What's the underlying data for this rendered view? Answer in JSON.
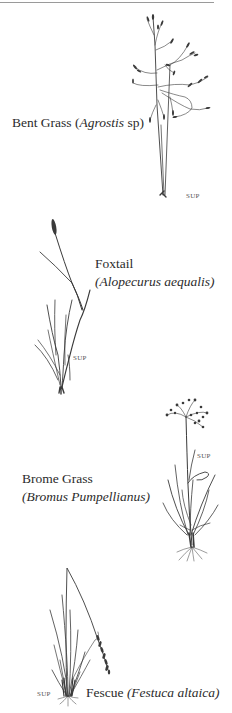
{
  "plants": [
    {
      "common_name": "Bent Grass",
      "scientific_name": "Agrostis",
      "scientific_suffix": " sp)",
      "label_prefix": "(",
      "sup": "SUP"
    },
    {
      "common_name": "Foxtail",
      "scientific_name": "(Alopecurus  aequalis)",
      "sup": "SUP"
    },
    {
      "common_name": "Brome Grass",
      "scientific_name": "(Bromus Pumpellianus)",
      "sup": "SUP"
    },
    {
      "common_name": "Fescue",
      "scientific_name": "(Festuca altaica)",
      "sup": "SUP"
    }
  ],
  "colors": {
    "ink": "#3a3a3a",
    "text": "#2b2b2b",
    "background": "#ffffff",
    "rule": "#9a9a9a"
  }
}
